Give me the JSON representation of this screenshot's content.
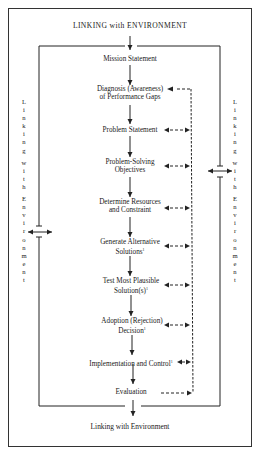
{
  "diagram": {
    "top_label": "LINKING with ENVIRONMENT",
    "bottom_label": "Linking with Environment",
    "left_side_label": "Linking with Environment",
    "right_side_label": "Linking with Environment",
    "steps": [
      {
        "line1": "Mission Statement",
        "line2": "",
        "footnote": "",
        "feedback": false
      },
      {
        "line1": "Diagnosis (Awareness)",
        "line2": "of Performance Gaps",
        "footnote": "",
        "feedback": true,
        "feedback_direction": "in"
      },
      {
        "line1": "Problem Statement",
        "line2": "",
        "footnote": "",
        "feedback": true,
        "feedback_direction": "both"
      },
      {
        "line1": "Problem-Solving",
        "line2": "Objectives",
        "footnote": "",
        "feedback": true,
        "feedback_direction": "both"
      },
      {
        "line1": "Determine Resources",
        "line2": "and Constraint",
        "footnote": "",
        "feedback": true,
        "feedback_direction": "both"
      },
      {
        "line1": "Generate Alternative",
        "line2": "Solutions",
        "footnote": "1",
        "feedback": true,
        "feedback_direction": "both"
      },
      {
        "line1": "Test Most Plausible",
        "line2": "Solution(s)",
        "footnote": "1",
        "feedback": true,
        "feedback_direction": "both"
      },
      {
        "line1": "Adoption (Rejection)",
        "line2": "Decision",
        "footnote": "1",
        "feedback": true,
        "feedback_direction": "both"
      },
      {
        "line1": "Implementation and Control",
        "line2": "",
        "footnote": "1",
        "feedback": true,
        "feedback_direction": "both"
      },
      {
        "line1": "Evaluation",
        "line2": "",
        "footnote": "",
        "feedback": true,
        "feedback_direction": "out"
      }
    ],
    "colors": {
      "line": "#222222",
      "background": "#ffffff"
    }
  }
}
